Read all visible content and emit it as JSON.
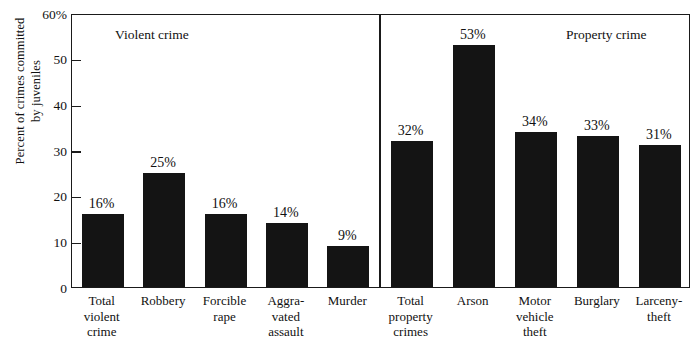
{
  "chart_data": {
    "type": "bar",
    "title": "",
    "xlabel": "",
    "ylabel": "Percent of crimes committed\nby juveniles",
    "ylim": [
      0,
      60
    ],
    "ytick_labels": [
      "60%",
      "50",
      "40",
      "30",
      "20",
      "10",
      "0"
    ],
    "ytick_values": [
      60,
      50,
      40,
      30,
      20,
      10,
      0
    ],
    "grid": false,
    "legend": "none",
    "bar_color": "#141414",
    "axis_color": "#1a1a1a",
    "background": "#ffffff",
    "panels": [
      {
        "caption": "Violent crime",
        "categories": [
          "Total\nviolent\ncrime",
          "Robbery",
          "Forcible\nrape",
          "Aggra-\nvated\nassault",
          "Murder"
        ],
        "values": [
          16,
          25,
          16,
          14,
          9
        ],
        "data_labels": [
          "16%",
          "25%",
          "16%",
          "14%",
          "9%"
        ]
      },
      {
        "caption": "Property crime",
        "categories": [
          "Total\nproperty\ncrimes",
          "Arson",
          "Motor\nvehicle\ntheft",
          "Burglary",
          "Larceny-\ntheft"
        ],
        "values": [
          32,
          53,
          34,
          33,
          31
        ],
        "data_labels": [
          "32%",
          "53%",
          "34%",
          "33%",
          "31%"
        ]
      }
    ]
  }
}
